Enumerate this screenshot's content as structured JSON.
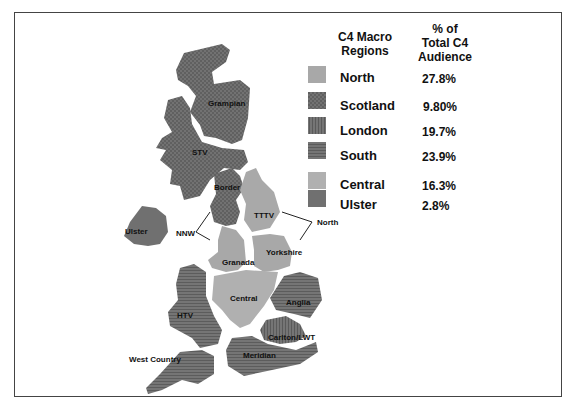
{
  "legend": {
    "header_regions": "C4 Macro\nRegions",
    "header_regions_line1": "C4 Macro",
    "header_regions_line2": "Regions",
    "header_pct_line1": "% of",
    "header_pct_line2": "Total C4",
    "header_pct_line3": "Audience",
    "items": [
      {
        "name": "North",
        "value": "27.8%",
        "color": "#a8a8a8",
        "pattern": "solid"
      },
      {
        "name": "Scotland",
        "value": "9.80%",
        "color": "#6e6e6e",
        "pattern": "crosshatch"
      },
      {
        "name": "London",
        "value": "19.7%",
        "color": "#6a6a6a",
        "pattern": "vertical-lines"
      },
      {
        "name": "South",
        "value": "23.9%",
        "color": "#6c6c6c",
        "pattern": "horizontal-lines"
      },
      {
        "name": "Central",
        "value": "16.3%",
        "color": "#b0b0b0",
        "pattern": "solid"
      },
      {
        "name": "Ulster",
        "value": "2.8%",
        "color": "#707070",
        "pattern": "solid"
      }
    ]
  },
  "map": {
    "labels": {
      "grampian": "Grampian",
      "stv": "STV",
      "border": "Border",
      "ulster": "Ulster",
      "nnw": "NNW",
      "tttv": "TTTV",
      "north": "North",
      "granada": "Granada",
      "yorkshire": "Yorkshire",
      "central": "Central",
      "anglia": "Anglia",
      "htv": "HTV",
      "carlton_lwt": "Carlton/LWT",
      "west_country": "West Country",
      "meridian": "Meridian"
    }
  }
}
